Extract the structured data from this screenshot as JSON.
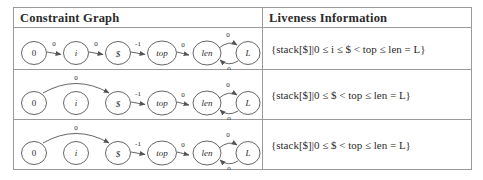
{
  "table": {
    "headers": {
      "left": "Constraint Graph",
      "right": "Liveness Information"
    },
    "rows": [
      {
        "id": "row-1",
        "graph": {
          "nodes": [
            {
              "id": "n0",
              "label": "0",
              "italic": false
            },
            {
              "id": "ni",
              "label": "i",
              "italic": true
            },
            {
              "id": "ndol",
              "label": "$",
              "italic": true
            },
            {
              "id": "ntop",
              "label": "top",
              "italic": true
            },
            {
              "id": "nlen",
              "label": "len",
              "italic": true
            },
            {
              "id": "nL",
              "label": "L",
              "italic": true
            }
          ],
          "edges": [
            {
              "from": "n0",
              "to": "ni",
              "label": "0",
              "style": "straight"
            },
            {
              "from": "ni",
              "to": "ndol",
              "label": "0",
              "style": "straight"
            },
            {
              "from": "ndol",
              "to": "ntop",
              "label": "-1",
              "style": "straight"
            },
            {
              "from": "ntop",
              "to": "nlen",
              "label": "0",
              "style": "straight"
            },
            {
              "from": "nlen",
              "to": "nL",
              "label": "0",
              "style": "curve-over"
            },
            {
              "from": "nL",
              "to": "nlen",
              "label": "0",
              "style": "curve-under"
            }
          ]
        },
        "liveness": "{stack[$]|0 ≤ i ≤ $ < top ≤ len = L}"
      },
      {
        "id": "row-2",
        "graph": {
          "nodes": [
            {
              "id": "n0",
              "label": "0",
              "italic": false
            },
            {
              "id": "ni",
              "label": "i",
              "italic": true
            },
            {
              "id": "ndol",
              "label": "$",
              "italic": true
            },
            {
              "id": "ntop",
              "label": "top",
              "italic": true
            },
            {
              "id": "nlen",
              "label": "len",
              "italic": true
            },
            {
              "id": "nL",
              "label": "L",
              "italic": true
            }
          ],
          "edges": [
            {
              "from": "n0",
              "to": "ndol",
              "label": "0",
              "style": "arc-over-i"
            },
            {
              "from": "ndol",
              "to": "ntop",
              "label": "-1",
              "style": "straight"
            },
            {
              "from": "ntop",
              "to": "nlen",
              "label": "0",
              "style": "straight"
            },
            {
              "from": "nlen",
              "to": "nL",
              "label": "0",
              "style": "curve-over"
            },
            {
              "from": "nL",
              "to": "nlen",
              "label": "0",
              "style": "curve-under"
            }
          ]
        },
        "liveness": "{stack[$]|0 ≤ $ < top ≤ len = L}"
      },
      {
        "id": "row-3",
        "graph": {
          "nodes": [
            {
              "id": "n0",
              "label": "0",
              "italic": false
            },
            {
              "id": "ni",
              "label": "i",
              "italic": true
            },
            {
              "id": "ndol",
              "label": "$",
              "italic": true
            },
            {
              "id": "ntop",
              "label": "top",
              "italic": true
            },
            {
              "id": "nlen",
              "label": "len",
              "italic": true
            },
            {
              "id": "nL",
              "label": "L",
              "italic": true
            }
          ],
          "edges": [
            {
              "from": "n0",
              "to": "ndol",
              "label": "0",
              "style": "arc-over-i"
            },
            {
              "from": "ndol",
              "to": "ntop",
              "label": "-1",
              "style": "straight"
            },
            {
              "from": "ntop",
              "to": "nlen",
              "label": "0",
              "style": "straight"
            },
            {
              "from": "nlen",
              "to": "nL",
              "label": "0",
              "style": "curve-over"
            },
            {
              "from": "nL",
              "to": "nlen",
              "label": "0",
              "style": "curve-under"
            }
          ]
        },
        "liveness": "{stack[$]|0 ≤ $ < top ≤ len = L}"
      }
    ]
  },
  "colors": {
    "border": "#9a9a9a",
    "stroke": "#555555",
    "text": "#2b2b2b",
    "background": "#ffffff"
  }
}
